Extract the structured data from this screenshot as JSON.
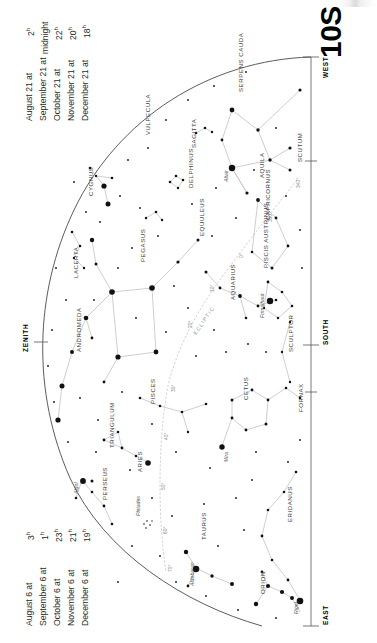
{
  "chart": {
    "number": "10S",
    "type": "star-chart",
    "hemisphere_label": "S",
    "projection": "horizon-dome"
  },
  "dates_top": {
    "caption": "",
    "rows": [
      {
        "date": "August 21 at",
        "time": "2",
        "unit": "h"
      },
      {
        "date": "September 21 at",
        "time": "midnight",
        "unit": ""
      },
      {
        "date": "October 21 at",
        "time": "22",
        "unit": "h"
      },
      {
        "date": "November 21 at",
        "time": "20",
        "unit": "h"
      },
      {
        "date": "December 21 at",
        "time": "18",
        "unit": "h"
      }
    ]
  },
  "dates_bottom": {
    "rows": [
      {
        "date": "August 6 at",
        "time": "3",
        "unit": "h"
      },
      {
        "date": "September 6 at",
        "time": "1",
        "unit": "h"
      },
      {
        "date": "October 6 at",
        "time": "23",
        "unit": "h"
      },
      {
        "date": "November 6 at",
        "time": "21",
        "unit": "h"
      },
      {
        "date": "December 6 at",
        "time": "19",
        "unit": "h"
      }
    ]
  },
  "directions": [
    {
      "label": "WEST",
      "id": "west"
    },
    {
      "label": "SOUTH",
      "id": "south"
    },
    {
      "label": "EAST",
      "id": "east"
    },
    {
      "label": "ZENITH",
      "id": "zenith"
    }
  ],
  "ecliptic": {
    "label": "ECLIPTIC",
    "degree_marks": [
      "340°",
      "350°",
      "0°",
      "10°",
      "20°",
      "30°",
      "40°",
      "50°",
      "60°",
      "70°"
    ]
  },
  "constellations": [
    {
      "name": "SERPENS CAUDA"
    },
    {
      "name": "SAGITTA"
    },
    {
      "name": "VULPECULA"
    },
    {
      "name": "AQUILA"
    },
    {
      "name": "SCUTUM"
    },
    {
      "name": "DELPHINUS"
    },
    {
      "name": "EQUULEUS"
    },
    {
      "name": "CAPRICORNUS"
    },
    {
      "name": "CYGNUS"
    },
    {
      "name": "LACERTA"
    },
    {
      "name": "PEGASUS"
    },
    {
      "name": "ANDROMEDA"
    },
    {
      "name": "AQUARIUS"
    },
    {
      "name": "PISCIS AUSTRINUS"
    },
    {
      "name": "SCULPTOR"
    },
    {
      "name": "FORNAX"
    },
    {
      "name": "PISCES"
    },
    {
      "name": "CETUS"
    },
    {
      "name": "TRIANGULUM"
    },
    {
      "name": "ARIES"
    },
    {
      "name": "PERSEUS"
    },
    {
      "name": "TAURUS"
    },
    {
      "name": "ORION"
    },
    {
      "name": "ERIDANUS"
    }
  ],
  "named_stars": [
    {
      "name": "Altair"
    },
    {
      "name": "Fomalhaut"
    },
    {
      "name": "Mira"
    },
    {
      "name": "Algol"
    },
    {
      "name": "Pleiades"
    },
    {
      "name": "Aldebaran"
    },
    {
      "name": "Rigel"
    }
  ],
  "colors": {
    "ink": "#1a1a1a",
    "star": "#111111",
    "constellation_line": "#bdbdbd",
    "horizon": "#4a4a4a",
    "grid_label": "#8a8a8a",
    "background": "#ffffff"
  }
}
